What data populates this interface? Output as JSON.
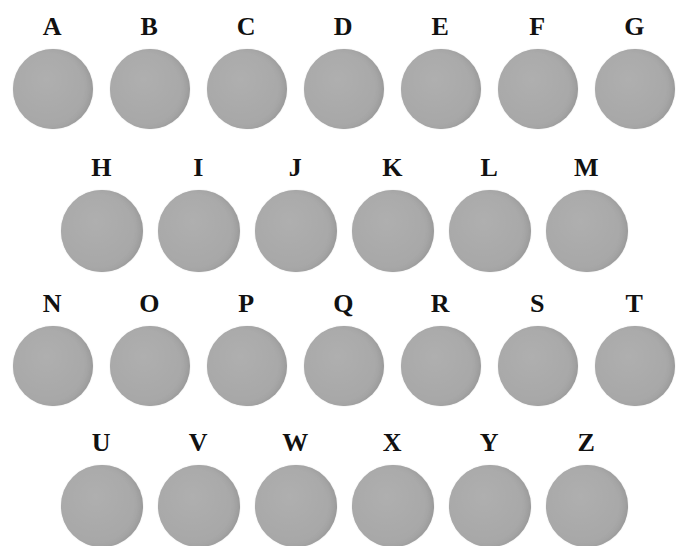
{
  "figure": {
    "background_color": "#ffffff",
    "circle_color": "#a9a9a9",
    "label_color": "#111111",
    "rows": [
      {
        "letters": [
          "A",
          "B",
          "C",
          "D",
          "E",
          "F",
          "G"
        ]
      },
      {
        "letters": [
          "H",
          "I",
          "J",
          "K",
          "L",
          "M"
        ]
      },
      {
        "letters": [
          "N",
          "O",
          "P",
          "Q",
          "R",
          "S",
          "T"
        ]
      },
      {
        "letters": [
          "U",
          "V",
          "W",
          "X",
          "Y",
          "Z"
        ]
      }
    ]
  }
}
